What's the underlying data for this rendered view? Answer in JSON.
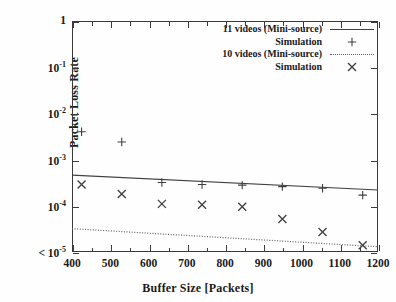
{
  "chart_data": {
    "type": "scatter",
    "title": "",
    "xlabel": "Buffer Size [Packets]",
    "ylabel": "Packet Loss Rate",
    "xlim": [
      400,
      1200
    ],
    "ylim": [
      1e-05,
      1
    ],
    "yscale": "log",
    "xscale": "linear",
    "grid": false,
    "legend_position": "top-right",
    "xticks": [
      400,
      500,
      600,
      700,
      800,
      900,
      1000,
      1100,
      1200
    ],
    "xticklabels": [
      "400",
      "500",
      "600",
      "700",
      "800",
      "900",
      "1000",
      "1100",
      "1200"
    ],
    "yticks": [
      1,
      0.1,
      0.01,
      0.001,
      0.0001,
      1e-05
    ],
    "yticklabels": [
      "1",
      "10^-1",
      "10^-2",
      "10^-3",
      "10^-4",
      "< 10^-5"
    ],
    "series": [
      {
        "name": "11 videos (Mini-source)",
        "style": "solid-line",
        "marker": "none",
        "color": "#404040",
        "x": [
          400,
          1200
        ],
        "values": [
          0.00046,
          0.00022
        ]
      },
      {
        "name": "Simulation",
        "group": "11 videos",
        "style": "points",
        "marker": "plus",
        "color": "#404040",
        "x": [
          425,
          530,
          635,
          740,
          845,
          950,
          1055,
          1160
        ],
        "values": [
          0.004,
          0.0024,
          0.00032,
          0.00029,
          0.00028,
          0.00026,
          0.00024,
          0.00017
        ]
      },
      {
        "name": "10 videos (Mini-source)",
        "style": "dotted-line",
        "marker": "none",
        "color": "#606060",
        "x": [
          400,
          1200
        ],
        "values": [
          3.2e-05,
          1.3e-05
        ]
      },
      {
        "name": "Simulation",
        "group": "10 videos",
        "style": "points",
        "marker": "cross",
        "color": "#404040",
        "x": [
          425,
          530,
          635,
          740,
          845,
          950,
          1055,
          1160
        ],
        "values": [
          0.00029,
          0.00018,
          0.00011,
          0.000105,
          9.5e-05,
          5.2e-05,
          2.7e-05,
          1.4e-05
        ]
      }
    ]
  },
  "axes": {
    "y_title": "Packet Loss Rate",
    "x_title": "Buffer Size [Packets]",
    "y_labels": [
      {
        "text": "1",
        "exp": ""
      },
      {
        "text": "10",
        "exp": "-1"
      },
      {
        "text": "10",
        "exp": "-2"
      },
      {
        "text": "10",
        "exp": "-3"
      },
      {
        "text": "10",
        "exp": "-4"
      },
      {
        "text": "< 10",
        "exp": "-5"
      }
    ],
    "x_labels": [
      "400",
      "500",
      "600",
      "700",
      "800",
      "900",
      "1000",
      "1100",
      "1200"
    ]
  },
  "legend": {
    "entries": [
      {
        "label": "11 videos (Mini-source)",
        "key": "solid-line"
      },
      {
        "label": "Simulation",
        "key": "plus-marker"
      },
      {
        "label": "10 videos (Mini-source)",
        "key": "dotted-line"
      },
      {
        "label": "Simulation",
        "key": "cross-marker"
      }
    ]
  }
}
